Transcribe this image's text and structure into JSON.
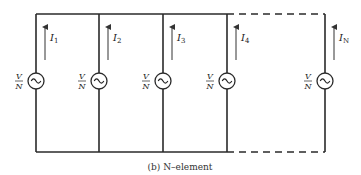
{
  "diagram": {
    "caption": "(b)  N–element",
    "layout": {
      "top_y": 14,
      "bottom_y": 152,
      "source_y": 81,
      "source_r": 8,
      "arrow_top": 27,
      "arrow_bottom": 60,
      "dashed_segment": {
        "from_x": 227,
        "to_x": 325
      }
    },
    "branches": [
      {
        "x": 36,
        "current_symbol": "I",
        "current_sub": "1",
        "source_label_num": "V",
        "source_label_den": "N"
      },
      {
        "x": 99,
        "current_symbol": "I",
        "current_sub": "2",
        "source_label_num": "V",
        "source_label_den": "N"
      },
      {
        "x": 163,
        "current_symbol": "I",
        "current_sub": "3",
        "source_label_num": "V",
        "source_label_den": "N"
      },
      {
        "x": 227,
        "current_symbol": "I",
        "current_sub": "4",
        "source_label_num": "V",
        "source_label_den": "N"
      },
      {
        "x": 325,
        "current_symbol": "I",
        "current_sub": "N",
        "source_label_num": "V",
        "source_label_den": "N"
      }
    ],
    "source_glyph": "ac-source-icon"
  }
}
